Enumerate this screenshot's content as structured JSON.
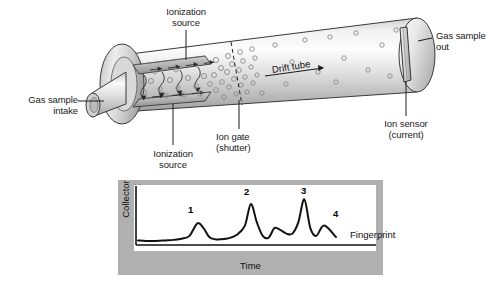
{
  "figure": {
    "type": "ion-mobility-spectrometer-cutaway",
    "background": "#ffffff"
  },
  "labels": {
    "ionization_source_top": "Ionization\nsource",
    "ionization_source_bottom": "Ionization\nsource",
    "gas_sample_intake": "Gas sample\nintake",
    "gas_sample_out": "Gas sample\nout",
    "drift_tube": "Drift tube",
    "ion_gate": "Ion gate\n(shutter)",
    "ion_sensor": "Ion sensor\n(current)"
  },
  "colors": {
    "panel_gray": "#b0b0b0",
    "plot_white": "#ffffff",
    "line": "#111111",
    "tube_light": "#f4f4f4",
    "tube_mid": "#d8d8d8",
    "tube_dark": "#a9a9a9",
    "text": "#1a1a1a"
  },
  "chart_data": {
    "type": "line",
    "title": "",
    "xlabel": "Time",
    "ylabel": "Collector current",
    "grid": false,
    "legend": null,
    "annotation": "Fingerprint",
    "peak_labels": [
      "1",
      "2",
      "3",
      "4"
    ],
    "axis_box": {
      "left_axis": true,
      "bottom_axis": true
    },
    "x": [
      0,
      4,
      9,
      14,
      18,
      22,
      26,
      30,
      33,
      36,
      39,
      42,
      46,
      50,
      54,
      57,
      60,
      63,
      66,
      69,
      72,
      75,
      78,
      81,
      84,
      87,
      90,
      94,
      100
    ],
    "y": [
      8,
      7,
      7,
      8,
      9,
      11,
      16,
      38,
      30,
      14,
      10,
      10,
      12,
      18,
      34,
      72,
      40,
      16,
      13,
      30,
      26,
      20,
      20,
      40,
      80,
      30,
      16,
      34,
      14
    ],
    "peaks": [
      {
        "label": "1",
        "x": 30,
        "height": 38
      },
      {
        "label": "2",
        "x": 57,
        "height": 72
      },
      {
        "label": "3",
        "x": 84,
        "height": 80
      },
      {
        "label": "4",
        "x": 94,
        "height": 34
      }
    ],
    "ylim": [
      0,
      100
    ],
    "xlim": [
      0,
      100
    ]
  }
}
